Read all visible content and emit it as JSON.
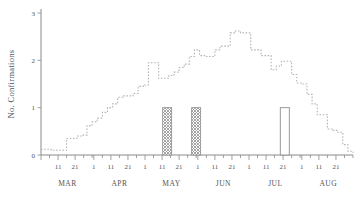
{
  "chart_data": {
    "type": "line",
    "title": "",
    "xlabel": "",
    "ylabel": "No. Confirmations",
    "ylim": [
      0,
      3
    ],
    "y_ticks": [
      0,
      1,
      2,
      3
    ],
    "y_tick_labels": [
      "0",
      "1",
      "2",
      "3"
    ],
    "grid": false,
    "legend": null,
    "x_axis": {
      "months": [
        "MAR",
        "APR",
        "MAY",
        "JUN",
        "JUL",
        "AUG"
      ],
      "day_tick_labels": [
        "11",
        "21",
        "1",
        "11",
        "21",
        "1",
        "11",
        "21",
        "1",
        "11",
        "21",
        "1",
        "11",
        "21",
        "1",
        "11",
        "21"
      ],
      "tick_interval_days": 5,
      "range_start": "MAR 1",
      "range_end": "AUG 31"
    },
    "series": [
      {
        "name": "No. Confirmations",
        "style": "dotted-step",
        "x": [
          1,
          4,
          7,
          10,
          13,
          16,
          19,
          22,
          25,
          28,
          31,
          34,
          37,
          40,
          43,
          46,
          49,
          52,
          55,
          58,
          61,
          64,
          67,
          70,
          73,
          76,
          79,
          82,
          85,
          88,
          91,
          94,
          97,
          100,
          103,
          106,
          109,
          112,
          115,
          118,
          121,
          124,
          127,
          130,
          133,
          136,
          139,
          142,
          145,
          148,
          151,
          154,
          157,
          160,
          163,
          166,
          169,
          172,
          175,
          178,
          181,
          184
        ],
        "values": [
          0.12,
          0.12,
          0.1,
          0.1,
          0.1,
          0.35,
          0.35,
          0.4,
          0.42,
          0.62,
          0.7,
          0.78,
          0.9,
          1.0,
          1.08,
          1.22,
          1.25,
          1.25,
          1.3,
          1.45,
          1.48,
          1.95,
          1.95,
          1.62,
          1.62,
          1.68,
          1.75,
          1.85,
          1.92,
          2.08,
          2.22,
          2.1,
          2.08,
          2.08,
          2.22,
          2.3,
          2.3,
          2.58,
          2.62,
          2.58,
          2.58,
          2.22,
          2.22,
          2.1,
          2.1,
          1.8,
          1.88,
          1.98,
          1.98,
          1.7,
          1.52,
          1.5,
          1.28,
          1.08,
          0.85,
          0.85,
          0.55,
          0.52,
          0.48,
          0.22,
          0.08,
          0.05
        ]
      }
    ],
    "bars": [
      {
        "label": "MAY 15",
        "x": 75,
        "value": 1.0,
        "fill": "crosshatch"
      },
      {
        "label": "JUN 1",
        "x": 92,
        "value": 1.0,
        "fill": "crosshatch"
      },
      {
        "label": "JUL 23",
        "x": 144,
        "value": 1.0,
        "fill": "open"
      }
    ],
    "colors": {
      "line": "#b5b5b5",
      "axis": "#8a8a8a",
      "bar_stroke": "#8f8f8f",
      "bar_open_fill": "#ffffff",
      "text": "#555555"
    }
  }
}
